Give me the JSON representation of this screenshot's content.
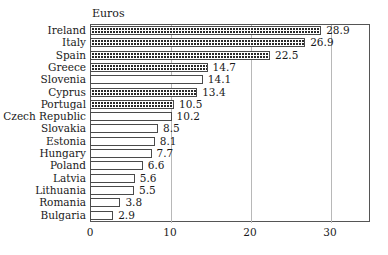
{
  "chart_data": {
    "type": "bar",
    "orientation": "horizontal",
    "title": "Euros",
    "xlabel": "",
    "ylabel": "",
    "xlim": [
      0,
      35
    ],
    "ylim": null,
    "grid": true,
    "legend": null,
    "xticks": [
      "0",
      "10",
      "20",
      "30"
    ],
    "xtick_values": [
      0,
      10,
      20,
      30
    ],
    "categories": [
      "Ireland",
      "Italy",
      "Spain",
      "Greece",
      "Slovenia",
      "Cyprus",
      "Portugal",
      "Czech Republic",
      "Slovakia",
      "Estonia",
      "Hungary",
      "Poland",
      "Latvia",
      "Lithuania",
      "Romania",
      "Bulgaria"
    ],
    "values": [
      28.9,
      26.9,
      22.5,
      14.7,
      14.1,
      13.4,
      10.5,
      10.2,
      8.5,
      8.1,
      7.7,
      6.6,
      5.6,
      5.5,
      3.8,
      2.9
    ],
    "value_labels": [
      "28.9",
      "26.9",
      "22.5",
      "14.7",
      "14.1",
      "13.4",
      "10.5",
      "10.2",
      "8.5",
      "8.1",
      "7.7",
      "6.6",
      "5.6",
      "5.5",
      "3.8",
      "2.9"
    ],
    "bar_fills": [
      "patterned",
      "patterned",
      "patterned",
      "patterned",
      "plain",
      "patterned",
      "patterned",
      "plain",
      "plain",
      "plain",
      "plain",
      "plain",
      "plain",
      "plain",
      "plain",
      "plain"
    ],
    "colors": {
      "bar_outline": "#4a4a4a",
      "bar_fill": "#ffffff",
      "pattern_dot": "#2a2a2a",
      "gridline": "#b8b8b8",
      "frame": "#555555",
      "text": "#1a1a1a"
    }
  }
}
